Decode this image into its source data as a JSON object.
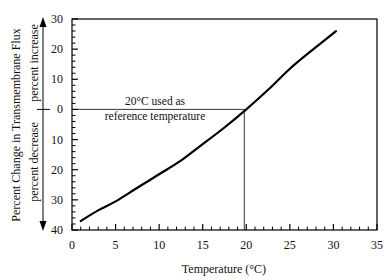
{
  "chart_data": {
    "type": "line",
    "title": "",
    "xlabel": "Temperature (°C)",
    "ylabel": "Percent Change in Transmembrane Flux",
    "ylabel_upper": "percent increase",
    "ylabel_lower": "percent decrease",
    "xlim": [
      0,
      35
    ],
    "ylim": [
      -40,
      30
    ],
    "x_ticks": [
      0,
      5,
      10,
      15,
      20,
      25,
      30,
      35
    ],
    "x_tick_labels": [
      "0",
      "5",
      "10",
      "15",
      "20",
      "25",
      "30",
      "35"
    ],
    "y_ticks": [
      30,
      20,
      10,
      0,
      -10,
      -20,
      -30,
      -40
    ],
    "y_tick_labels": [
      "30",
      "20",
      "10",
      "0",
      "10",
      "20",
      "30",
      "40"
    ],
    "grid": false,
    "legend": null,
    "series": [
      {
        "name": "Percent change in flux",
        "x": [
          1,
          3,
          5,
          7.5,
          10,
          12.5,
          15,
          17.5,
          20,
          22.5,
          25,
          27.5,
          30.3
        ],
        "values": [
          -37,
          -33.5,
          -30.5,
          -26,
          -21.5,
          -17,
          -11.5,
          -6,
          0,
          6.5,
          13.5,
          19.5,
          26
        ]
      }
    ],
    "annotations": [
      {
        "text_line1": "20°C used as",
        "text_line2": "reference temperature",
        "reference_x": 20,
        "reference_y": 0
      }
    ]
  }
}
